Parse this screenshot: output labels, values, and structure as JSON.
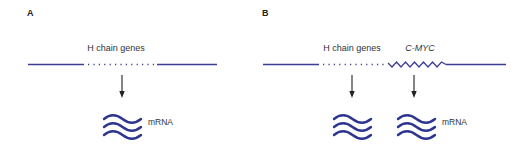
{
  "colors": {
    "dna_line": "#3b3f96",
    "mrna": "#2e3591",
    "arrow": "#222222",
    "text": "#333333"
  },
  "panels": [
    {
      "id": "A",
      "letter": "A",
      "gene_labels": [
        {
          "text": "H chain genes",
          "italic": false
        }
      ],
      "dna_segments": [
        "solid",
        "dotted",
        "solid"
      ],
      "transcripts": [
        {
          "source": "H chain genes",
          "product_label": "mRNA"
        }
      ]
    },
    {
      "id": "B",
      "letter": "B",
      "gene_labels": [
        {
          "text": "H chain genes",
          "italic": false
        },
        {
          "text": "C-MYC",
          "italic": true
        }
      ],
      "dna_segments": [
        "solid",
        "dotted",
        "zigzag",
        "solid"
      ],
      "transcripts": [
        {
          "source": "H chain genes",
          "product_label": ""
        },
        {
          "source": "C-MYC",
          "product_label": "mRNA"
        }
      ]
    }
  ]
}
